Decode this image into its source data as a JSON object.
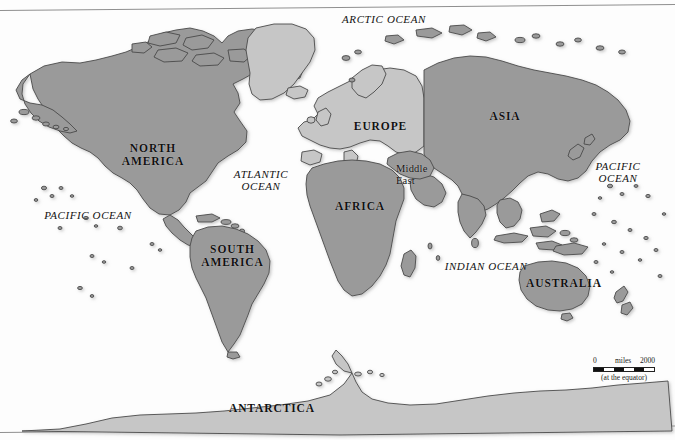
{
  "map": {
    "title": "World Map",
    "projection_note": "(at the equator)",
    "colors": {
      "land_primary": "#9a9a9a",
      "land_secondary": "#c6c6c6",
      "land_outline": "#4a4a4a",
      "ocean": "#fdfdfd",
      "frame_line": "#8f8f8f",
      "label_text": "#111111"
    },
    "continents": [
      {
        "id": "north-america",
        "label": "NORTH\nAMERICA",
        "x": 108,
        "y": 142,
        "width": 90,
        "shade": "primary"
      },
      {
        "id": "south-america",
        "label": "SOUTH\nAMERICA",
        "x": 190,
        "y": 243,
        "width": 85,
        "shade": "primary"
      },
      {
        "id": "africa",
        "label": "AFRICA",
        "x": 320,
        "y": 200,
        "width": 80,
        "shade": "primary"
      },
      {
        "id": "europe",
        "label": "EUROPE",
        "x": 338,
        "y": 120,
        "width": 85,
        "shade": "secondary"
      },
      {
        "id": "asia",
        "label": "ASIA",
        "x": 470,
        "y": 110,
        "width": 70,
        "shade": "primary"
      },
      {
        "id": "australia",
        "label": "AUSTRALIA",
        "x": 519,
        "y": 277,
        "width": 90,
        "shade": "primary"
      },
      {
        "id": "antarctica",
        "label": "ANTARCTICA",
        "x": 217,
        "y": 402,
        "width": 110,
        "shade": "secondary"
      }
    ],
    "regions": [
      {
        "id": "middle-east",
        "label": "Middle\nEast",
        "x": 396,
        "y": 163
      }
    ],
    "oceans": [
      {
        "id": "arctic-ocean",
        "label": "ARCTIC OCEAN",
        "x": 329,
        "y": 13,
        "width": 110
      },
      {
        "id": "atlantic-ocean",
        "label": "ATLANTIC\nOCEAN",
        "x": 222,
        "y": 168,
        "width": 78
      },
      {
        "id": "pacific-ocean-west",
        "label": "PACIFIC OCEAN",
        "x": 33,
        "y": 209,
        "width": 110
      },
      {
        "id": "pacific-ocean-east",
        "label": "PACIFIC\nOCEAN",
        "x": 586,
        "y": 160,
        "width": 64
      },
      {
        "id": "indian-ocean",
        "label": "INDIAN OCEAN",
        "x": 432,
        "y": 260,
        "width": 108
      }
    ],
    "scale": {
      "zero": "0",
      "units": "miles",
      "max": "2000",
      "note": "(at the equator)"
    }
  }
}
